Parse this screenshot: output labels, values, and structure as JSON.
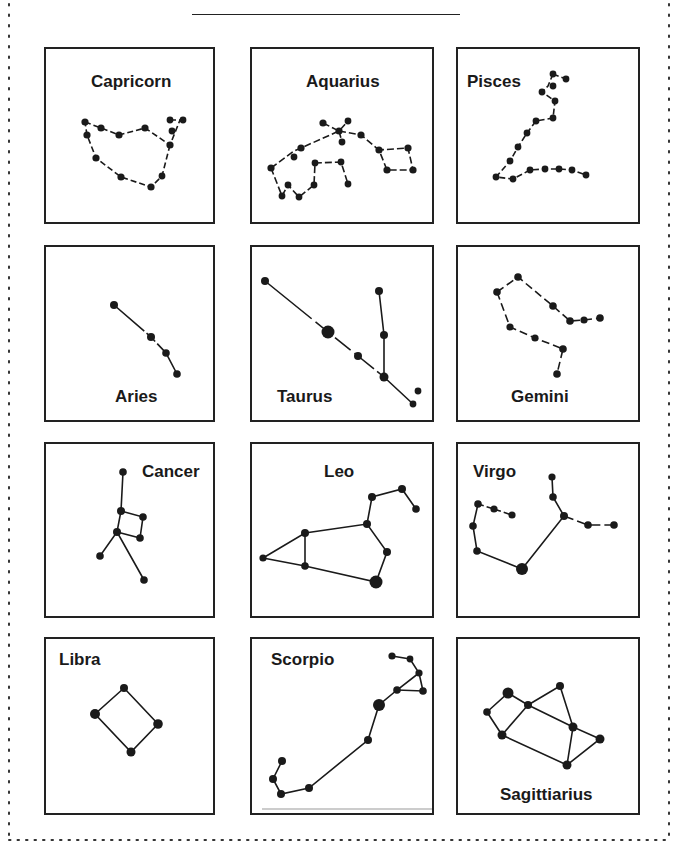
{
  "page": {
    "title_line": "",
    "constellations": [
      {
        "name": "Capricorn"
      },
      {
        "name": "Aquarius"
      },
      {
        "name": "Pisces"
      },
      {
        "name": "Aries"
      },
      {
        "name": "Taurus"
      },
      {
        "name": "Gemini"
      },
      {
        "name": "Cancer"
      },
      {
        "name": "Leo"
      },
      {
        "name": "Virgo"
      },
      {
        "name": "Libra"
      },
      {
        "name": "Scorpio"
      },
      {
        "name": "Sagittiarius"
      }
    ]
  },
  "colors": {
    "ink": "#1a1a1a",
    "background": "#ffffff"
  }
}
